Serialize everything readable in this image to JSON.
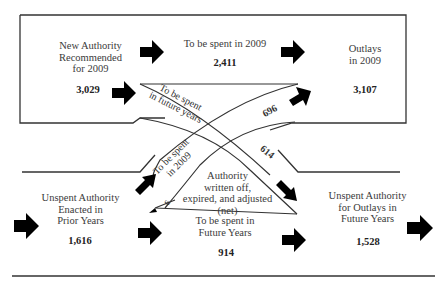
{
  "diagram": {
    "type": "budget-authority-flow",
    "nodes": {
      "new_authority": {
        "label": "New Authority Recommended for 2009",
        "lines": [
          "New Authority",
          "Recommended",
          "for 2009"
        ],
        "value": "3,029"
      },
      "spent_2009_new": {
        "label": "To be spent in 2009",
        "value": "2,411"
      },
      "outlays_2009": {
        "label": "Outlays in 2009",
        "lines": [
          "Outlays",
          "in 2009"
        ],
        "value": "3,107"
      },
      "unspent_prior": {
        "label": "Unspent Authority Enacted in Prior Years",
        "lines": [
          "Unspent Authority",
          "Enacted in",
          "Prior Years"
        ],
        "value": "1,616"
      },
      "written_off": {
        "label": "Authority written off, expired, and adjusted (net)",
        "lines": [
          "Authority",
          "written off,",
          "expired, and adjusted",
          "(net)"
        ],
        "value": "6"
      },
      "future_years_prior": {
        "label": "To be spent in Future Years",
        "lines": [
          "To be spent in",
          "Future Years"
        ],
        "value": "914"
      },
      "unspent_future": {
        "label": "Unspent Authority for Outlays in Future Years",
        "lines": [
          "Unspent Authority",
          "for Outlays in",
          "Future Years"
        ],
        "value": "1,528"
      }
    },
    "flows": {
      "new_to_future": {
        "label_lines": [
          "To be spent",
          "in future years"
        ],
        "value": "614"
      },
      "prior_to_2009": {
        "label_lines": [
          "To be spent",
          "in 2009"
        ],
        "value": "696"
      }
    },
    "colors": {
      "line": "#333333",
      "arrow": "#000000",
      "text": "#3a3a3a"
    }
  }
}
